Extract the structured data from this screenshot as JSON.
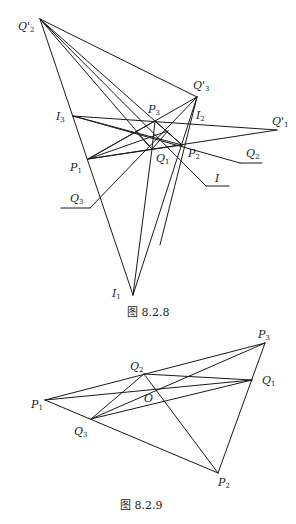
{
  "figure1": {
    "caption": "图 8.2.8",
    "points": {
      "Q'2": [
        40,
        19
      ],
      "Q'3": [
        197,
        97
      ],
      "Q'1": [
        277,
        130
      ],
      "I3": [
        73,
        116
      ],
      "I2": [
        190,
        124
      ],
      "I1": [
        133,
        295
      ],
      "P1": [
        88,
        159
      ],
      "P3": [
        155,
        121
      ],
      "P2": [
        182,
        145
      ],
      "Q1": [
        152,
        149
      ]
    },
    "labels": [
      {
        "text": "Q'",
        "sub": "2",
        "x": 18,
        "y": 30
      },
      {
        "text": "Q'",
        "sub": "3",
        "x": 193,
        "y": 89
      },
      {
        "text": "Q'",
        "sub": "1",
        "x": 272,
        "y": 125
      },
      {
        "text": "I",
        "sub": "3",
        "x": 56,
        "y": 120
      },
      {
        "text": "I",
        "sub": "2",
        "x": 196,
        "y": 119
      },
      {
        "text": "I",
        "sub": "1",
        "x": 112,
        "y": 297
      },
      {
        "text": "P",
        "sub": "1",
        "x": 70,
        "y": 171
      },
      {
        "text": "P",
        "sub": "3",
        "x": 148,
        "y": 113
      },
      {
        "text": "P",
        "sub": "2",
        "x": 188,
        "y": 157
      },
      {
        "text": "Q",
        "sub": "1",
        "x": 156,
        "y": 162
      },
      {
        "text": "Q",
        "sub": "2",
        "x": 246,
        "y": 157
      },
      {
        "text": "Q",
        "sub": "3",
        "x": 70,
        "y": 202
      },
      {
        "text": "I",
        "sub": "",
        "x": 215,
        "y": 182
      }
    ]
  },
  "figure2": {
    "caption": "图 8.2.9",
    "points": {
      "P1": [
        45,
        400
      ],
      "P2": [
        218,
        473
      ],
      "P3": [
        265,
        343
      ],
      "Q1": [
        252,
        380
      ],
      "Q2": [
        144,
        374
      ],
      "Q3": [
        91,
        419
      ],
      "O": [
        156,
        390
      ]
    },
    "labels": [
      {
        "text": "P",
        "sub": "1",
        "x": 31,
        "y": 408
      },
      {
        "text": "P",
        "sub": "2",
        "x": 218,
        "y": 486
      },
      {
        "text": "P",
        "sub": "3",
        "x": 258,
        "y": 338
      },
      {
        "text": "Q",
        "sub": "1",
        "x": 262,
        "y": 384
      },
      {
        "text": "Q",
        "sub": "2",
        "x": 130,
        "y": 370
      },
      {
        "text": "Q",
        "sub": "3",
        "x": 74,
        "y": 435
      },
      {
        "text": "O",
        "sub": "",
        "x": 144,
        "y": 402
      }
    ]
  }
}
